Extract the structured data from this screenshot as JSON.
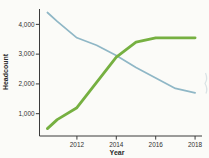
{
  "figure": {
    "ylabel": "Headcount",
    "xlabel": "Year",
    "y_tick_labels": [
      "1,000",
      "2,000",
      "3,000",
      "4,000"
    ],
    "x_tick_labels": [
      "2012",
      "2014",
      "2016",
      "2018"
    ]
  },
  "chart_data": {
    "type": "line",
    "title": "",
    "xlabel": "Year",
    "ylabel": "Headcount",
    "x": [
      2010.5,
      2011,
      2012,
      2013,
      2014,
      2015,
      2016,
      2017,
      2018
    ],
    "series": [
      {
        "name": "blue-declining-line",
        "color": "#8fb7c6",
        "stroke_width": 1.7,
        "values": [
          4400,
          4100,
          3550,
          3300,
          2950,
          2550,
          2200,
          1850,
          1700
        ]
      },
      {
        "name": "green-rising-line",
        "color": "#76b041",
        "stroke_width": 2.8,
        "values": [
          500,
          800,
          1200,
          2050,
          2900,
          3400,
          3550,
          3550,
          3550
        ]
      }
    ],
    "x_tick_values": [
      2012,
      2014,
      2016,
      2018
    ],
    "y_tick_values": [
      1000,
      2000,
      3000,
      4000
    ],
    "xlim": [
      2010.1,
      2018.25
    ],
    "ylim": [
      250,
      4550
    ],
    "grid": false,
    "legend": false,
    "axis_color": "#3b3b3b"
  }
}
